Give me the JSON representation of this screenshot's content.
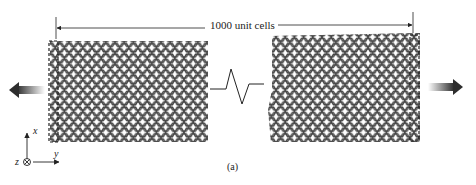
{
  "figure": {
    "dimension_label": "1000 unit cells",
    "panel_label": "(a)",
    "axes": {
      "x_label": "x",
      "y_label": "y",
      "z_label": "z",
      "z_symbol": "into-page-icon"
    },
    "left_sheet": {
      "description": "graphene sheet (left segment)",
      "pull_direction": "left"
    },
    "right_sheet": {
      "description": "graphene sheet (right segment)",
      "pull_direction": "right"
    },
    "break_symbol": "zigzag break indicating omitted length",
    "colors": {
      "lattice": "#3a3a3a",
      "arrow_dark": "#333333",
      "arrow_light": "#ffffff",
      "line": "#222222"
    }
  }
}
